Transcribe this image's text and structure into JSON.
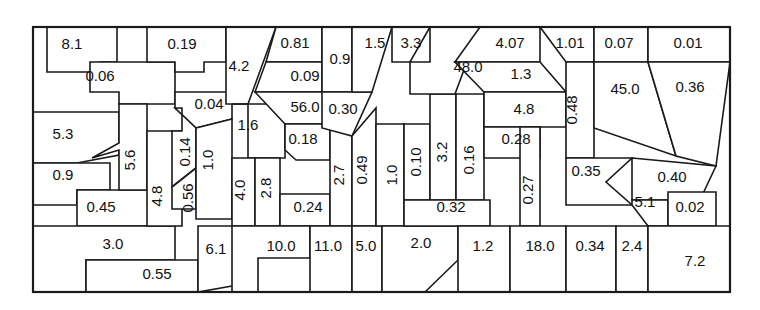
{
  "figure": {
    "type": "treemap-partition",
    "title": "",
    "background_color": "#ffffff",
    "line_color": "#1a1a1a",
    "label_color": "#111111",
    "frame": {
      "x": 33,
      "y": 27,
      "width": 697,
      "height": 265
    }
  },
  "chart_data": {
    "type": "treemap",
    "title": "",
    "xlabel": "",
    "ylabel": "",
    "grid": false,
    "legend": "none",
    "value_count": 62,
    "values": [
      8.1,
      0.19,
      0.81,
      0.09,
      1.5,
      3.3,
      4.07,
      1.01,
      0.07,
      0.01,
      0.06,
      4.2,
      0.9,
      48.0,
      1.3,
      0.48,
      45.0,
      0.36,
      0.04,
      56.0,
      0.3,
      4.8,
      0.35,
      0.4,
      5.3,
      5.6,
      0.14,
      1.6,
      0.18,
      0.28,
      0.27,
      0.9,
      4.8,
      1.0,
      4.0,
      2.8,
      2.7,
      0.49,
      1.0,
      0.1,
      3.2,
      0.16,
      0.45,
      0.56,
      0.24,
      0.32,
      5.1,
      0.02,
      3.0,
      6.1,
      10.0,
      11.0,
      5.0,
      2.0,
      1.2,
      18.0,
      0.34,
      2.4,
      7.2,
      0.55
    ],
    "cells": [
      {
        "id": "c-8-1",
        "label": "8.1",
        "value": 8.1,
        "orient": "h",
        "lx": 72,
        "ly": 45,
        "points": "47,27 117,27 117,62 100,62 90,72 47,72"
      },
      {
        "id": "c-0-06",
        "label": "0.06",
        "value": 0.06,
        "orient": "h",
        "lx": 100,
        "ly": 77,
        "points": "90,62 175,62 175,104 119,104 119,92 90,92"
      },
      {
        "id": "c-5-3",
        "label": "5.3",
        "value": 5.3,
        "orient": "h",
        "lx": 63,
        "ly": 135,
        "points": "33,112 119,112 119,155 77,163 33,163"
      },
      {
        "id": "c-0-9a",
        "label": "0.9",
        "value": 0.9,
        "orient": "h",
        "lx": 63,
        "ly": 176,
        "points": "33,163 110,163 110,190 77,190 77,205 33,205"
      },
      {
        "id": "c-0-45",
        "label": "0.45",
        "value": 0.45,
        "orient": "h",
        "lx": 101,
        "ly": 208,
        "points": "77,190 160,190 160,226 77,226"
      },
      {
        "id": "c-3-0",
        "label": "3.0",
        "value": 3.0,
        "orient": "h",
        "lx": 113,
        "ly": 245,
        "points": "33,226 175,226 175,260 86,260 86,292 33,292 33,226"
      },
      {
        "id": "c-0-55",
        "label": "0.55",
        "value": 0.55,
        "orient": "h",
        "lx": 157,
        "ly": 275,
        "points": "86,260 198,260 198,292 86,292"
      },
      {
        "id": "c-5-6",
        "label": "5.6",
        "value": 5.6,
        "orient": "v",
        "lx": 131,
        "ly": 160,
        "points": "119,104 147,104 147,190 119,190 119,150 92,158 119,143"
      },
      {
        "id": "c-0-19",
        "label": "0.19",
        "value": 0.19,
        "orient": "h",
        "lx": 182,
        "ly": 45,
        "points": "147,27 226,27 226,62 204,62 204,72 175,72 175,62 147,62"
      },
      {
        "id": "c-4-8a",
        "label": "4.8",
        "value": 4.8,
        "orient": "v",
        "lx": 158,
        "ly": 196,
        "points": "147,131 182,131 182,226 147,226"
      },
      {
        "id": "c-0-04",
        "label": "0.04",
        "value": 0.04,
        "orient": "h",
        "lx": 209,
        "ly": 105,
        "points": "175,92 232,92 232,119 196,128 175,108"
      },
      {
        "id": "c-0-14",
        "label": "0.14",
        "value": 0.14,
        "orient": "v",
        "lx": 186,
        "ly": 152,
        "points": "175,108 196,128 196,168 172,187 172,131 182,131 182,108"
      },
      {
        "id": "c-0-56",
        "label": "0.56",
        "value": 0.56,
        "orient": "v",
        "lx": 189,
        "ly": 198,
        "points": "172,187 196,168 196,209 172,209"
      },
      {
        "id": "c-1-0a",
        "label": "1.0",
        "value": 1.0,
        "orient": "v",
        "lx": 209,
        "ly": 160,
        "points": "196,128 232,119 232,219 196,219"
      },
      {
        "id": "c-6-1",
        "label": "6.1",
        "value": 6.1,
        "orient": "h",
        "lx": 216,
        "ly": 250,
        "points": "198,226 232,226 258,256 232,286 198,292"
      },
      {
        "id": "c-4-2",
        "label": "4.2",
        "value": 4.2,
        "orient": "h",
        "lx": 239,
        "ly": 67,
        "points": "226,27 254,27 276,27 248,104 226,104"
      },
      {
        "id": "c-1-6",
        "label": "1.6",
        "value": 1.6,
        "orient": "h",
        "lx": 248,
        "ly": 126,
        "points": "232,104 285,104 285,158 248,158 248,104"
      },
      {
        "id": "c-4-0",
        "label": "4.0",
        "value": 4.0,
        "orient": "v",
        "lx": 241,
        "ly": 190,
        "points": "232,158 255,158 255,226 232,226"
      },
      {
        "id": "c-2-8",
        "label": "2.8",
        "value": 2.8,
        "orient": "v",
        "lx": 267,
        "ly": 188,
        "points": "255,158 280,158 280,226 255,226"
      },
      {
        "id": "c-0-81",
        "label": "0.81",
        "value": 0.81,
        "orient": "h",
        "lx": 295,
        "ly": 44,
        "points": "276,27 322,27 322,62 266,62"
      },
      {
        "id": "c-0-09",
        "label": "0.09",
        "value": 0.09,
        "orient": "h",
        "lx": 305,
        "ly": 77,
        "points": "266,62 322,62 322,92 255,92"
      },
      {
        "id": "c-56-0",
        "label": "56.0",
        "value": 56.0,
        "orient": "h",
        "lx": 305,
        "ly": 108,
        "points": "255,92 330,92 330,124 285,124"
      },
      {
        "id": "c-0-18",
        "label": "0.18",
        "value": 0.18,
        "orient": "h",
        "lx": 303,
        "ly": 140,
        "points": "285,124 330,124 330,160 296,160 285,150"
      },
      {
        "id": "c-0-24",
        "label": "0.24",
        "value": 0.24,
        "orient": "h",
        "lx": 308,
        "ly": 208,
        "points": "280,194 330,194 330,226 280,226"
      },
      {
        "id": "c-2-7",
        "label": "2.7",
        "value": 2.7,
        "orient": "v",
        "lx": 340,
        "ly": 175,
        "points": "330,124 352,136 352,226 330,226"
      },
      {
        "id": "c-0-9b",
        "label": "0.9",
        "value": 0.9,
        "orient": "h",
        "lx": 340,
        "ly": 60,
        "points": "322,27 352,27 352,92 322,92"
      },
      {
        "id": "c-0-30",
        "label": "0.30",
        "value": 0.3,
        "orient": "h",
        "lx": 343,
        "ly": 110,
        "points": "322,92 372,92 352,136 322,128"
      },
      {
        "id": "c-1-5",
        "label": "1.5",
        "value": 1.5,
        "orient": "h",
        "lx": 375,
        "ly": 44,
        "points": "352,27 392,27 372,92 352,92"
      },
      {
        "id": "c-3-3",
        "label": "3.3",
        "value": 3.3,
        "orient": "h",
        "lx": 411,
        "ly": 44,
        "points": "392,27 430,27 410,62 392,62"
      },
      {
        "id": "c-10-0",
        "label": "10.0",
        "value": 10.0,
        "orient": "h",
        "lx": 281,
        "ly": 247,
        "points": "232,226 310,226 310,258 258,258 258,292 232,292"
      },
      {
        "id": "c-11-0",
        "label": "11.0",
        "value": 11.0,
        "orient": "h",
        "lx": 328,
        "ly": 247,
        "points": "310,226 352,226 352,292 310,292"
      },
      {
        "id": "c-0-49",
        "label": "0.49",
        "value": 0.49,
        "orient": "v",
        "lx": 363,
        "ly": 170,
        "points": "352,136 376,108 376,226 352,226"
      },
      {
        "id": "c-5-0",
        "label": "5.0",
        "value": 5.0,
        "orient": "h",
        "lx": 366,
        "ly": 247,
        "points": "352,226 382,226 382,292 352,292"
      },
      {
        "id": "c-1-0b",
        "label": "1.0",
        "value": 1.0,
        "orient": "v",
        "lx": 393,
        "ly": 175,
        "points": "376,124 404,124 404,226 376,226"
      },
      {
        "id": "c-2-0",
        "label": "2.0",
        "value": 2.0,
        "orient": "h",
        "lx": 421,
        "ly": 244,
        "points": "382,226 458,226 458,260 425,292 382,292 382,254"
      },
      {
        "id": "c-0-10",
        "label": "0.10",
        "value": 0.1,
        "orient": "v",
        "lx": 417,
        "ly": 162,
        "points": "404,124 430,124 430,200 404,200"
      },
      {
        "id": "c-3-2",
        "label": "3.2",
        "value": 3.2,
        "orient": "v",
        "lx": 443,
        "ly": 152,
        "points": "430,94 456,94 456,200 430,200"
      },
      {
        "id": "c-0-16",
        "label": "0.16",
        "value": 0.16,
        "orient": "v",
        "lx": 470,
        "ly": 160,
        "points": "456,94 484,94 484,200 456,200"
      },
      {
        "id": "c-0-32",
        "label": "0.32",
        "value": 0.32,
        "orient": "h",
        "lx": 451,
        "ly": 208,
        "points": "404,200 490,200 490,226 404,226"
      },
      {
        "id": "c-48-0",
        "label": "48.0",
        "value": 48.0,
        "orient": "h",
        "lx": 468,
        "ly": 68,
        "points": "430,27 480,27 455,94 410,94 410,62 430,62"
      },
      {
        "id": "c-4-07",
        "label": "4.07",
        "value": 4.07,
        "orient": "h",
        "lx": 510,
        "ly": 44,
        "points": "480,27 540,27 540,62 455,62"
      },
      {
        "id": "c-1-3",
        "label": "1.3",
        "value": 1.3,
        "orient": "h",
        "lx": 521,
        "ly": 75,
        "points": "455,62 540,62 566,92 484,92"
      },
      {
        "id": "c-4-8b",
        "label": "4.8",
        "value": 4.8,
        "orient": "h",
        "lx": 524,
        "ly": 110,
        "points": "484,92 566,92 566,127 484,127"
      },
      {
        "id": "c-0-28",
        "label": "0.28",
        "value": 0.28,
        "orient": "h",
        "lx": 516,
        "ly": 140,
        "points": "484,127 540,127 540,158 484,158"
      },
      {
        "id": "c-0-27",
        "label": "0.27",
        "value": 0.27,
        "orient": "v",
        "lx": 529,
        "ly": 190,
        "points": "520,127 540,127 540,226 520,226"
      },
      {
        "id": "c-1-2",
        "label": "1.2",
        "value": 1.2,
        "orient": "h",
        "lx": 483,
        "ly": 247,
        "points": "458,226 510,226 510,292 458,292"
      },
      {
        "id": "c-18-0",
        "label": "18.0",
        "value": 18.0,
        "orient": "h",
        "lx": 540,
        "ly": 247,
        "points": "510,226 566,226 566,292 510,292"
      },
      {
        "id": "c-1-01",
        "label": "1.01",
        "value": 1.01,
        "orient": "h",
        "lx": 570,
        "ly": 44,
        "points": "540,27 594,27 594,62 566,62"
      },
      {
        "id": "c-0-48",
        "label": "0.48",
        "value": 0.48,
        "orient": "v",
        "lx": 573,
        "ly": 110,
        "points": "566,62 594,62 594,158 566,158"
      },
      {
        "id": "c-0-07",
        "label": "0.07",
        "value": 0.07,
        "orient": "h",
        "lx": 619,
        "ly": 44,
        "points": "594,27 648,27 648,62 594,62"
      },
      {
        "id": "c-45-0",
        "label": "45.0",
        "value": 45.0,
        "orient": "h",
        "lx": 625,
        "ly": 90,
        "points": "594,62 648,62 676,156 594,128"
      },
      {
        "id": "c-0-35",
        "label": "0.35",
        "value": 0.35,
        "orient": "h",
        "lx": 586,
        "ly": 172,
        "points": "566,158 632,158 606,182 632,205 566,205"
      },
      {
        "id": "c-0-34",
        "label": "0.34",
        "value": 0.34,
        "orient": "h",
        "lx": 590,
        "ly": 247,
        "points": "566,226 616,226 616,292 566,292"
      },
      {
        "id": "c-2-4",
        "label": "2.4",
        "value": 2.4,
        "orient": "h",
        "lx": 632,
        "ly": 247,
        "points": "616,226 648,226 648,292 616,292"
      },
      {
        "id": "c-0-01",
        "label": "0.01",
        "value": 0.01,
        "orient": "h",
        "lx": 688,
        "ly": 44,
        "points": "648,27 730,27 730,62 648,62"
      },
      {
        "id": "c-0-36",
        "label": "0.36",
        "value": 0.36,
        "orient": "h",
        "lx": 690,
        "ly": 88,
        "points": "648,62 730,62 716,166 676,156"
      },
      {
        "id": "c-0-40",
        "label": "0.40",
        "value": 0.4,
        "orient": "h",
        "lx": 672,
        "ly": 178,
        "points": "632,158 716,166 700,200 632,200"
      },
      {
        "id": "c-5-1",
        "label": "5.1",
        "value": 5.1,
        "orient": "h",
        "lx": 645,
        "ly": 203,
        "points": "632,200 668,200 668,226 648,226 632,205"
      },
      {
        "id": "c-0-02",
        "label": "0.02",
        "value": 0.02,
        "orient": "h",
        "lx": 690,
        "ly": 208,
        "points": "668,192 716,192 716,226 668,226"
      },
      {
        "id": "c-7-2",
        "label": "7.2",
        "value": 7.2,
        "orient": "h",
        "lx": 695,
        "ly": 262,
        "points": "648,226 730,226 730,292 648,292"
      }
    ]
  }
}
